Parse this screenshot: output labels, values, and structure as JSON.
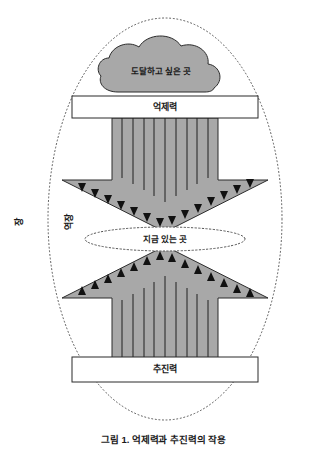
{
  "figure": {
    "caption": "그림 1. 억제력과 추진력의 작용",
    "outer_field_label": "장",
    "inner_field_label": "역장",
    "cloud_label": "도달하고 싶은 곳",
    "top_box_label": "억제력",
    "middle_ellipse_label": "지금 있는 곳",
    "bottom_box_label": "추진력",
    "colors": {
      "shape_fill": "#a8a8a8",
      "shape_stroke": "#2b2b2b",
      "box_fill": "#ffffff",
      "box_stroke": "#2b2b2b",
      "dotted_stroke": "#555555",
      "text": "#1a1a1a",
      "background": "#ffffff"
    },
    "arrow_line_count": 9,
    "down_arrowhead_count": 12,
    "up_arrowhead_count": 12
  }
}
